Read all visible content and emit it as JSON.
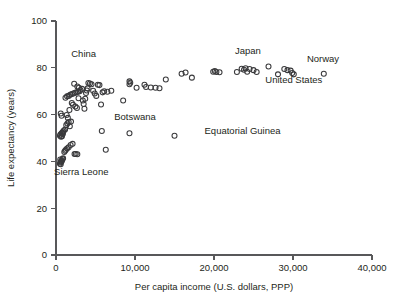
{
  "chart_data": {
    "type": "scatter",
    "title": "",
    "xlabel": "Per capita income (U.S. dollars, PPP)",
    "ylabel": "Life expectancy (years)",
    "xlim": [
      0,
      40000
    ],
    "ylim": [
      0,
      100
    ],
    "grid": false,
    "legend": "none",
    "xticks": [
      0,
      10000,
      20000,
      30000,
      40000
    ],
    "xtick_labels": [
      "0",
      "10,000",
      "20,000",
      "30,000",
      "40,000"
    ],
    "yticks": [
      0,
      20,
      40,
      60,
      80,
      100
    ],
    "ytick_labels": [
      "0",
      "20",
      "40",
      "60",
      "80",
      "100"
    ],
    "marker": "open-circle",
    "marker_color": "#3a3a3c",
    "points": [
      [
        500,
        39.0
      ],
      [
        560,
        39.5
      ],
      [
        620,
        40.0
      ],
      [
        700,
        40.2
      ],
      [
        760,
        40.5
      ],
      [
        820,
        41.0
      ],
      [
        900,
        41.3
      ],
      [
        600,
        38.8
      ],
      [
        680,
        39.8
      ],
      [
        540,
        40.8
      ],
      [
        1050,
        44.0
      ],
      [
        1150,
        44.5
      ],
      [
        1250,
        45.0
      ],
      [
        1400,
        45.5
      ],
      [
        1600,
        46.0
      ],
      [
        1850,
        47.0
      ],
      [
        2100,
        47.5
      ],
      [
        2350,
        43.2
      ],
      [
        2500,
        43.2
      ],
      [
        2700,
        43.1
      ],
      [
        500,
        51.0
      ],
      [
        560,
        51.5
      ],
      [
        700,
        52.0
      ],
      [
        820,
        52.3
      ],
      [
        900,
        52.8
      ],
      [
        1000,
        53.2
      ],
      [
        1150,
        53.6
      ],
      [
        760,
        50.8
      ],
      [
        640,
        50.5
      ],
      [
        880,
        51.8
      ],
      [
        1300,
        55.5
      ],
      [
        1450,
        56.2
      ],
      [
        1600,
        56.8
      ],
      [
        1750,
        55.0
      ],
      [
        1900,
        57.0
      ],
      [
        600,
        60.5
      ],
      [
        700,
        59.5
      ],
      [
        1350,
        59.8
      ],
      [
        1500,
        58.6
      ],
      [
        1700,
        62.0
      ],
      [
        1200,
        67.2
      ],
      [
        1400,
        67.8
      ],
      [
        1600,
        68.0
      ],
      [
        1800,
        68.5
      ],
      [
        2000,
        68.8
      ],
      [
        2200,
        69.0
      ],
      [
        2400,
        69.3
      ],
      [
        2600,
        69.5
      ],
      [
        2800,
        69.8
      ],
      [
        3000,
        70.0
      ],
      [
        2300,
        73.2
      ],
      [
        2700,
        72.0
      ],
      [
        2900,
        71.5
      ],
      [
        3100,
        70.5
      ],
      [
        3300,
        71.0
      ],
      [
        3400,
        66.0
      ],
      [
        3500,
        64.5
      ],
      [
        3600,
        62.5
      ],
      [
        3700,
        66.8
      ],
      [
        3800,
        69.2
      ],
      [
        3900,
        70.3
      ],
      [
        4000,
        71.2
      ],
      [
        4100,
        73.5
      ],
      [
        4300,
        73.3
      ],
      [
        4500,
        73.0
      ],
      [
        4700,
        70.2
      ],
      [
        4900,
        69.0
      ],
      [
        5100,
        68.0
      ],
      [
        5300,
        72.8
      ],
      [
        5500,
        72.6
      ],
      [
        5700,
        64.3
      ],
      [
        5900,
        69.5
      ],
      [
        6100,
        70.0
      ],
      [
        6500,
        69.8
      ],
      [
        7000,
        70.2
      ],
      [
        2000,
        65.0
      ],
      [
        2150,
        64.2
      ],
      [
        2450,
        63.5
      ],
      [
        2650,
        62.8
      ],
      [
        2850,
        67.0
      ],
      [
        5800,
        53.0
      ],
      [
        6300,
        45.0
      ],
      [
        9300,
        52.0
      ],
      [
        15000,
        51.0
      ],
      [
        8500,
        66.0
      ],
      [
        9300,
        74.2
      ],
      [
        9300,
        73.0
      ],
      [
        9400,
        73.6
      ],
      [
        10200,
        71.5
      ],
      [
        11200,
        72.8
      ],
      [
        11400,
        71.8
      ],
      [
        12000,
        71.6
      ],
      [
        12600,
        71.5
      ],
      [
        13100,
        71.3
      ],
      [
        13900,
        75.0
      ],
      [
        15900,
        77.5
      ],
      [
        16400,
        78.0
      ],
      [
        17200,
        75.8
      ],
      [
        19900,
        78.3
      ],
      [
        20300,
        78.2
      ],
      [
        20700,
        78.1
      ],
      [
        20100,
        78.6
      ],
      [
        22900,
        78.2
      ],
      [
        23500,
        79.6
      ],
      [
        23800,
        79.2
      ],
      [
        24000,
        79.8
      ],
      [
        24200,
        78.3
      ],
      [
        24500,
        79.5
      ],
      [
        25000,
        79.0
      ],
      [
        25400,
        78.2
      ],
      [
        26900,
        80.6
      ],
      [
        28100,
        77.2
      ],
      [
        28900,
        79.5
      ],
      [
        29300,
        79.0
      ],
      [
        29700,
        78.8
      ],
      [
        29900,
        77.8
      ],
      [
        30100,
        77.2
      ],
      [
        33900,
        77.5
      ]
    ],
    "annotations": [
      {
        "label": "China",
        "x": 3500,
        "y": 84.5,
        "anchor": "middle"
      },
      {
        "label": "Sierra Leone",
        "x": 3200,
        "y": 34.0,
        "anchor": "middle"
      },
      {
        "label": "Botswana",
        "x": 10000,
        "y": 57.5,
        "anchor": "middle"
      },
      {
        "label": "Equatorial Guinea",
        "x": 18800,
        "y": 51.5,
        "anchor": "start"
      },
      {
        "label": "Japan",
        "x": 24300,
        "y": 86.0,
        "anchor": "middle"
      },
      {
        "label": "Norway",
        "x": 33800,
        "y": 82.5,
        "anchor": "middle"
      },
      {
        "label": "United States",
        "x": 30100,
        "y": 73.5,
        "anchor": "middle"
      }
    ]
  }
}
